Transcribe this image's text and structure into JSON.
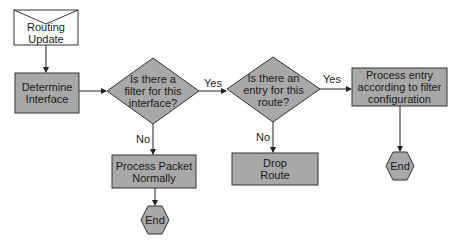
{
  "diagram": {
    "type": "flowchart",
    "colors": {
      "fill": "#a8a8a8",
      "stroke": "#3a3a3a",
      "background": "#ffffff",
      "start_fill": "#ffffff"
    },
    "nodes": {
      "start": {
        "shape": "envelope",
        "line1": "Routing",
        "line2": "Update"
      },
      "determine": {
        "shape": "rect",
        "line1": "Determine",
        "line2": "Interface"
      },
      "q_filter": {
        "shape": "diamond",
        "line1": "Is there a",
        "line2": "filter for this",
        "line3": "interface?"
      },
      "q_entry": {
        "shape": "diamond",
        "line1": "Is there an",
        "line2": "entry for this",
        "line3": "route?"
      },
      "process_entry": {
        "shape": "rect",
        "line1": "Process entry",
        "line2": "according to filter",
        "line3": "configuration"
      },
      "process_packet": {
        "shape": "rect",
        "line1": "Process Packet",
        "line2": "Normally"
      },
      "drop_route": {
        "shape": "rect",
        "line1": "Drop",
        "line2": "Route"
      },
      "end_left": {
        "shape": "hexagon",
        "label": "End"
      },
      "end_right": {
        "shape": "hexagon",
        "label": "End"
      }
    },
    "edges": {
      "filter_yes": "Yes",
      "filter_no": "No",
      "entry_yes": "Yes",
      "entry_no": "No"
    }
  }
}
